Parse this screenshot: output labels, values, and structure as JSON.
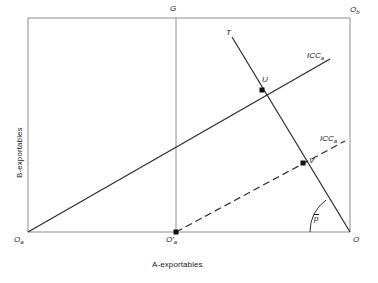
{
  "figure": {
    "type": "economics-box-diagram",
    "background_color": "#ffffff",
    "line_color": "#2b2b2b",
    "frame_color": "#8c8c8c",
    "axes": {
      "x_label": "A-exportables",
      "y_label": "B-exportables"
    },
    "box": {
      "left": 28,
      "top": 18,
      "right": 350,
      "bottom": 232
    },
    "labels": [
      {
        "name": "origin-a",
        "text": "O",
        "subscript": "a",
        "prime": false,
        "x": 14,
        "y": 238
      },
      {
        "name": "origin-b",
        "text": "O",
        "subscript": "b",
        "prime": false,
        "x": 350,
        "y": 8
      },
      {
        "name": "origin-a-shifted",
        "text": "O",
        "subscript": "a",
        "prime": true,
        "x": 166,
        "y": 238
      },
      {
        "name": "origin",
        "text": "O",
        "subscript": "",
        "prime": false,
        "x": 352,
        "y": 238
      },
      {
        "name": "point-g",
        "text": "G",
        "subscript": "",
        "prime": false,
        "x": 170,
        "y": 6
      },
      {
        "name": "point-t",
        "text": "T",
        "subscript": "",
        "prime": false,
        "x": 226,
        "y": 30
      },
      {
        "name": "point-u",
        "text": "U",
        "subscript": "",
        "prime": false,
        "x": 262,
        "y": 78
      },
      {
        "name": "point-v",
        "text": "V",
        "subscript": "",
        "prime": false,
        "x": 310,
        "y": 158
      },
      {
        "name": "icc-a-solid",
        "text": "ICC",
        "subscript": "a",
        "prime": false,
        "x": 307,
        "y": 53
      },
      {
        "name": "icc-a-dashed",
        "text": "ICC",
        "subscript": "a",
        "prime": false,
        "x": 320,
        "y": 136
      },
      {
        "name": "price-ratio",
        "text": "p",
        "subscript": "",
        "prime": false,
        "x": 314,
        "y": 216
      }
    ],
    "points": [
      {
        "name": "point-u-marker",
        "x": 262,
        "y": 90
      },
      {
        "name": "point-v-marker",
        "x": 303,
        "y": 163
      },
      {
        "name": "origin-a-shifted-marker",
        "x": 176,
        "y": 232
      }
    ],
    "lines": {
      "vertical_g": {
        "x": 176,
        "y1": 18,
        "y2": 232,
        "style": "solid",
        "color": "#8c8c8c"
      },
      "icc_solid": {
        "x1": 28,
        "y1": 232,
        "x2": 330,
        "y2": 59,
        "style": "solid"
      },
      "icc_dashed": {
        "x1": 176,
        "y1": 232,
        "x2": 345,
        "y2": 141,
        "style": "dashed"
      },
      "offer_curve_t": {
        "x1": 232,
        "y1": 37,
        "x2": 350,
        "y2": 232,
        "style": "solid"
      },
      "price_arc": {
        "cx": 350,
        "cy": 232,
        "r": 40,
        "style": "solid"
      }
    }
  }
}
